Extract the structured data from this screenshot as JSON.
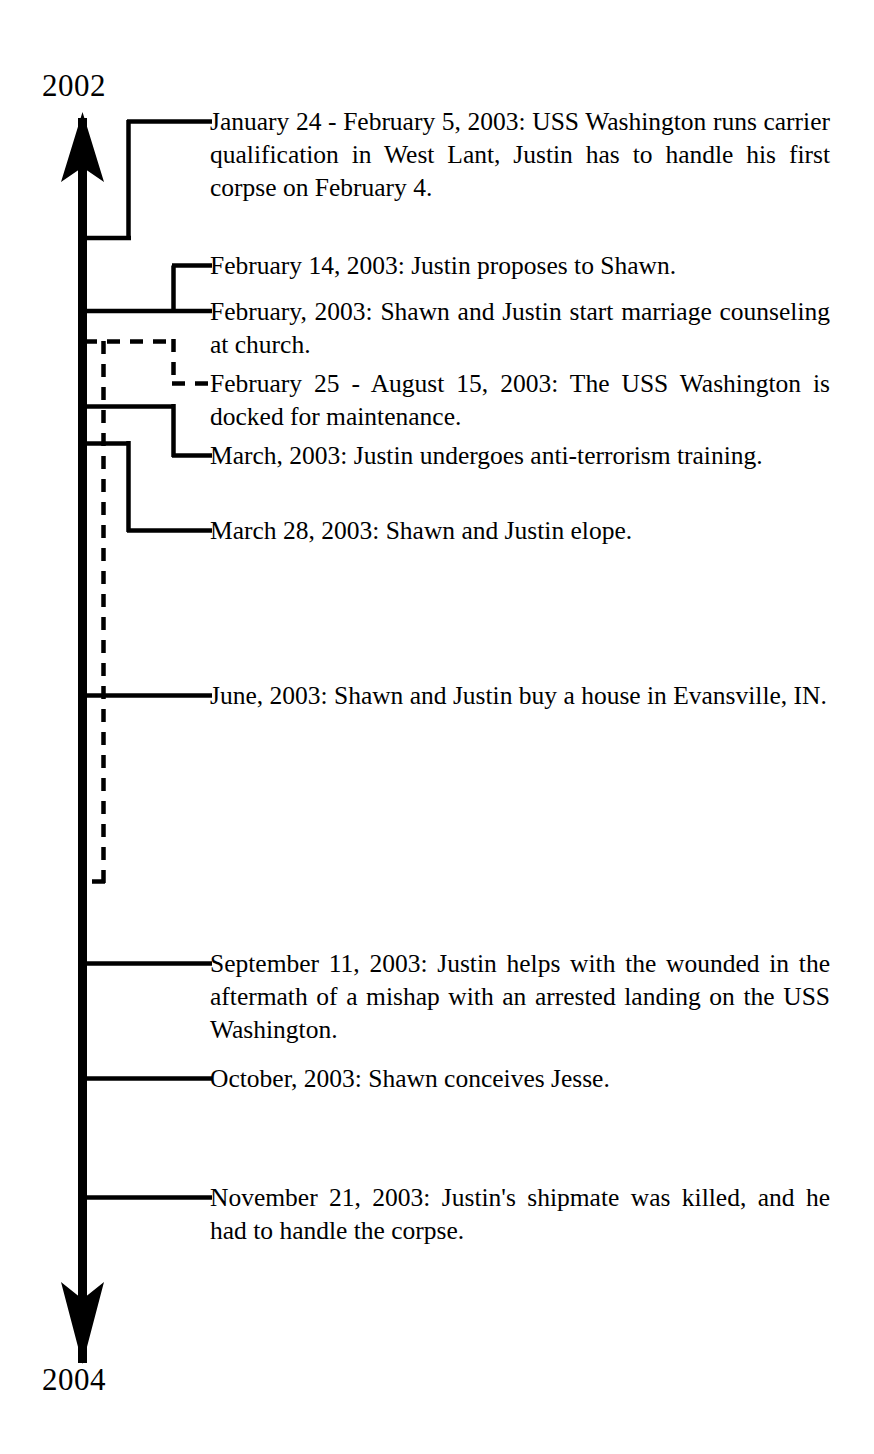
{
  "diagram": {
    "type": "timeline",
    "orientation": "vertical",
    "axis_direction": "downward",
    "title": "",
    "start_label": "2002",
    "end_label": "2004",
    "line_color": "#000000",
    "background_color": "#ffffff",
    "events": [
      {
        "id": "jan-24-feb-5-2003",
        "date": "January 24 - February 5, 2003",
        "text": "January 24 - February 5, 2003:  USS Washing­ton runs carrier qualification in West Lant, Justin has to handle his first corpse on Febru­ary 4.",
        "connector": "span-bracket",
        "style": "solid"
      },
      {
        "id": "feb-14-2003",
        "date": "February 14, 2003",
        "text": "February 14, 2003:  Justin proposes to Shawn.",
        "connector": "elbow",
        "style": "solid"
      },
      {
        "id": "feb-2003",
        "date": "February, 2003",
        "text": "February, 2003:  Shawn and Justin start mar­riage counseling at church.",
        "connector": "straight",
        "style": "solid"
      },
      {
        "id": "feb-25-aug-15-2003",
        "date": "February 25 - August 15, 2003",
        "text": "February 25 - August 15, 2003:  The USS Washington is docked for maintenance.",
        "connector": "span-bracket",
        "style": "dashed"
      },
      {
        "id": "march-2003",
        "date": "March, 2003",
        "text": "March, 2003:  Justin undergoes anti-terrorism training.",
        "connector": "elbow",
        "style": "solid"
      },
      {
        "id": "march-28-2003",
        "date": "March 28, 2003",
        "text": "March 28, 2003:  Shawn and Justin elope.",
        "connector": "elbow",
        "style": "solid"
      },
      {
        "id": "june-2003",
        "date": "June, 2003",
        "text": "June, 2003:  Shawn and Justin buy a house in Evansville, IN.",
        "connector": "straight",
        "style": "solid"
      },
      {
        "id": "sept-11-2003",
        "date": "September 11, 2003",
        "text": "September 11, 2003:  Justin helps with the wounded in the aftermath of a mishap with an arrested landing on the USS Washington.",
        "connector": "straight",
        "style": "solid"
      },
      {
        "id": "october-2003",
        "date": "October, 2003",
        "text": "October, 2003: Shawn conceives Jesse.",
        "connector": "straight",
        "style": "solid"
      },
      {
        "id": "nov-21-2003",
        "date": "November 21, 2003",
        "text": "November 21, 2003:  Justin's shipmate was killed, and he had to handle the corpse.",
        "connector": "straight",
        "style": "solid"
      }
    ]
  }
}
